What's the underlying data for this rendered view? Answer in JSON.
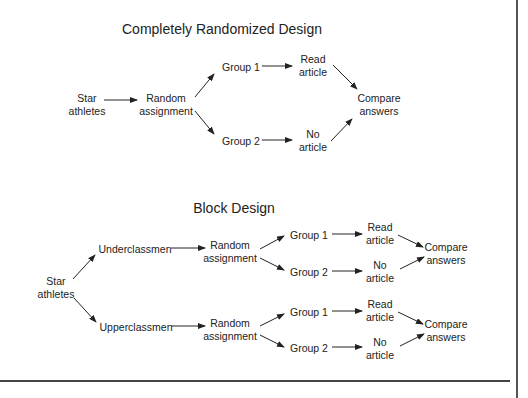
{
  "diagrams": [
    {
      "title": "Completely Randomized Design",
      "nodes": {
        "population": [
          "Star",
          "athletes"
        ],
        "random_assignment": [
          "Random",
          "assignment"
        ],
        "group1": "Group 1",
        "group2": "Group 2",
        "treatment1": [
          "Read",
          "article"
        ],
        "treatment2": [
          "No",
          "article"
        ],
        "compare": [
          "Compare",
          "answers"
        ]
      }
    },
    {
      "title": "Block Design",
      "nodes": {
        "population": [
          "Star",
          "athletes"
        ],
        "blocks": [
          {
            "label": "Underclassmen",
            "random_assignment": [
              "Random",
              "assignment"
            ],
            "group1": "Group 1",
            "group2": "Group 2",
            "treatment1": [
              "Read",
              "article"
            ],
            "treatment2": [
              "No",
              "article"
            ],
            "compare": [
              "Compare",
              "answers"
            ]
          },
          {
            "label": "Upperclassmen",
            "random_assignment": [
              "Random",
              "assignment"
            ],
            "group1": "Group 1",
            "group2": "Group 2",
            "treatment1": [
              "Read",
              "article"
            ],
            "treatment2": [
              "No",
              "article"
            ],
            "compare": [
              "Compare",
              "answers"
            ]
          }
        ]
      }
    }
  ],
  "colors": {
    "text": "#222222",
    "arrow": "#222222",
    "rule": "#444444",
    "background": "#ffffff"
  }
}
